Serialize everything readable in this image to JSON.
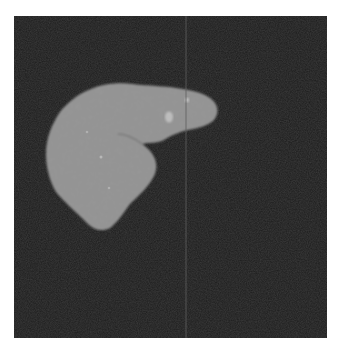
{
  "image": {
    "subject": "Axial CT slice showing segmented liver on dark masked background",
    "alt": "Grayscale CT scan of a liver"
  },
  "colors": {
    "page_background": "#ffffff",
    "panel_background": "#1b1b1b",
    "organ_fill": "#8a8a8a",
    "organ_highlight": "#b5b5b5",
    "scan_line": "#6a6a6a"
  },
  "panel": {
    "x": 14,
    "y": 16,
    "width": 313,
    "height": 322
  },
  "scan_line": {
    "x": 172
  }
}
